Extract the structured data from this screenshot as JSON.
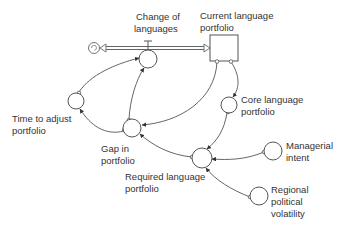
{
  "diagram": {
    "type": "stock-and-flow",
    "colors": {
      "line": "#555555",
      "text": "#333333",
      "background": "#ffffff"
    },
    "source": {
      "icon": "cloud-source-icon"
    },
    "flow": {
      "label_line1": "Change of",
      "label_line2": "languages"
    },
    "stock": {
      "label_line1": "Current language",
      "label_line2": "portfolio"
    },
    "auxiliaries": {
      "core": {
        "label_line1": "Core language",
        "label_line2": "portfolio"
      },
      "time": {
        "label_line1": "Time to adjust",
        "label_line2": "portfolio"
      },
      "gap": {
        "label_line1": "Gap in",
        "label_line2": "portfolio"
      },
      "required": {
        "label_line1": "Required language",
        "label_line2": "portfolio"
      },
      "managerial": {
        "label_line1": "Managerial",
        "label_line2": "intent"
      },
      "regional": {
        "label_line1": "Regional",
        "label_line2": "political",
        "label_line3": "volatility"
      }
    },
    "links": [
      {
        "from": "Current language portfolio",
        "to": "Core language portfolio"
      },
      {
        "from": "Current language portfolio",
        "to": "Gap in portfolio"
      },
      {
        "from": "Core language portfolio",
        "to": "Required language portfolio"
      },
      {
        "from": "Managerial intent",
        "to": "Required language portfolio"
      },
      {
        "from": "Regional political volatility",
        "to": "Required language portfolio"
      },
      {
        "from": "Required language portfolio",
        "to": "Gap in portfolio"
      },
      {
        "from": "Gap in portfolio",
        "to": "Change of languages"
      },
      {
        "from": "Gap in portfolio",
        "to": "Time to adjust portfolio"
      },
      {
        "from": "Time to adjust portfolio",
        "to": "Change of languages"
      }
    ]
  }
}
